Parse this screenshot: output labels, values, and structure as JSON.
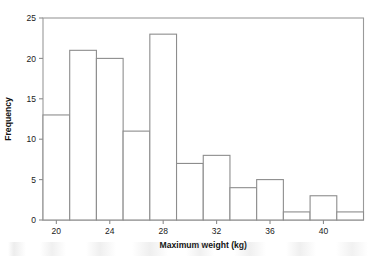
{
  "chart_data": {
    "type": "bar",
    "title": "",
    "subtitle": "",
    "xlabel": "Maximum weight (kg)",
    "ylabel": "Frequency",
    "xlim": [
      19,
      43
    ],
    "ylim": [
      0,
      25
    ],
    "bin_width": 2,
    "grid": false,
    "legend": null,
    "xticks": [
      20,
      24,
      28,
      32,
      36,
      40
    ],
    "xtick_labels": [
      "20",
      "24",
      "28",
      "32",
      "36",
      "40"
    ],
    "yticks": [
      0,
      5,
      10,
      15,
      20,
      25
    ],
    "ytick_labels": [
      "0",
      "5",
      "10",
      "15",
      "20",
      "25"
    ],
    "bin_edges": [
      19,
      21,
      23,
      25,
      27,
      29,
      31,
      33,
      35,
      37,
      39,
      41,
      43
    ],
    "categories": [
      "19-21",
      "21-23",
      "23-25",
      "25-27",
      "27-29",
      "29-31",
      "31-33",
      "33-35",
      "35-37",
      "37-39",
      "39-41",
      "41-43"
    ],
    "values": [
      13,
      21,
      20,
      11,
      23,
      7,
      8,
      4,
      5,
      1,
      3,
      1
    ],
    "colors": {
      "bar_fill": "#ffffff",
      "bar_stroke": "#8d8d8d",
      "frame_stroke": "#9a9a9a",
      "text": "#1a1a1a",
      "background": "#ffffff"
    }
  }
}
